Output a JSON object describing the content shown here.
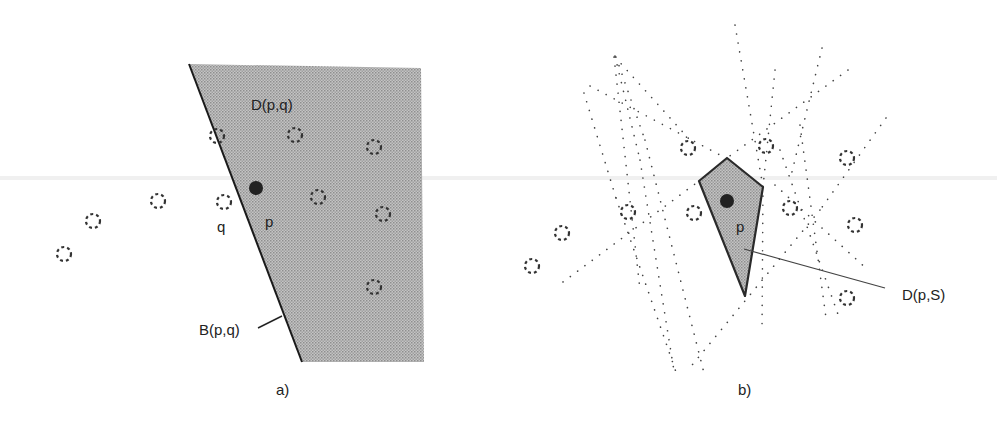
{
  "figure": {
    "panel_a": {
      "caption": "a)",
      "region_label": "D(p,q)",
      "bisector_label": "B(p,q)",
      "point_p_label": "p",
      "point_q_label": "q",
      "shade_color": "#b4b4b4",
      "region_polygon": [
        [
          189,
          64
        ],
        [
          421,
          68
        ],
        [
          424,
          362
        ],
        [
          302,
          362
        ]
      ],
      "point_p": [
        256,
        188
      ],
      "point_q": [
        224,
        202
      ],
      "other_sites": [
        [
          217,
          136
        ],
        [
          295,
          135
        ],
        [
          374,
          147
        ],
        [
          318,
          197
        ],
        [
          383,
          214
        ],
        [
          374,
          287
        ],
        [
          158,
          201
        ],
        [
          93,
          221
        ],
        [
          64,
          254
        ]
      ]
    },
    "panel_b": {
      "caption": "b)",
      "region_label": "D(p,S)",
      "point_p_label": "p",
      "shade_color": "#b4b4b4",
      "cell_polygon": [
        [
          699,
          181
        ],
        [
          727,
          158
        ],
        [
          763,
          187
        ],
        [
          745,
          296
        ]
      ],
      "point_p": [
        727,
        201
      ],
      "other_sites": [
        [
          688,
          148
        ],
        [
          766,
          146
        ],
        [
          847,
          158
        ],
        [
          628,
          212
        ],
        [
          694,
          213
        ],
        [
          790,
          208
        ],
        [
          855,
          225
        ],
        [
          562,
          233
        ],
        [
          532,
          266
        ],
        [
          847,
          298
        ]
      ]
    }
  }
}
